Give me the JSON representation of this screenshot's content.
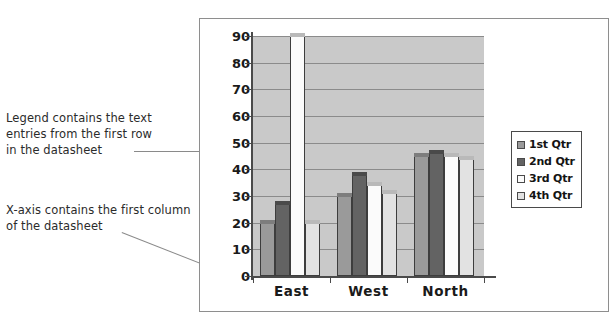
{
  "annotations": {
    "legend_note": "Legend contains the text\nentries from the first row\nin the datasheet",
    "xaxis_note": "X-axis contains the first column\nof the datasheet"
  },
  "chart_data": {
    "type": "bar",
    "title": "",
    "xlabel": "",
    "ylabel": "",
    "categories": [
      "East",
      "West",
      "North"
    ],
    "series": [
      {
        "name": "1st Qtr",
        "values": [
          20,
          30,
          45
        ],
        "color": "#9a9a9a"
      },
      {
        "name": "2nd Qtr",
        "values": [
          27,
          38,
          46
        ],
        "color": "#636363"
      },
      {
        "name": "3rd Qtr",
        "values": [
          90,
          34,
          45
        ],
        "color": "#fbfbfb"
      },
      {
        "name": "4th Qtr",
        "values": [
          20,
          31,
          44
        ],
        "color": "#e2e2e2"
      }
    ],
    "ylim": [
      0,
      90
    ],
    "yticks": [
      0,
      10,
      20,
      30,
      40,
      50,
      60,
      70,
      80,
      90
    ],
    "ytick_labels": [
      "0",
      "10",
      "20",
      "30",
      "40",
      "50",
      "60",
      "70",
      "80",
      "90"
    ],
    "grid": true,
    "legend_position": "right",
    "legend_entries": [
      "1st Qtr",
      "2nd Qtr",
      "3rd Qtr",
      "4th Qtr"
    ],
    "plot_background": "#c9c9c9",
    "gridline_color": "#8b8b8b",
    "axis_color": "#4a4a4a"
  }
}
